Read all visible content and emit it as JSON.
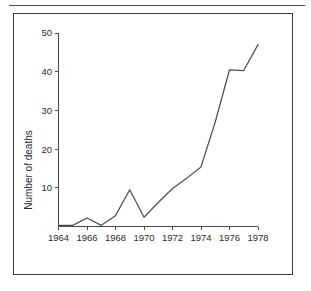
{
  "figure": {
    "has_top_rule": true,
    "has_frame_border": true,
    "frame_color": "#3c3c3c",
    "background_color": "#ffffff",
    "line_color": "#4f4f4f"
  },
  "chart_data": {
    "type": "line",
    "title": "",
    "xlabel": "",
    "ylabel": "Number of deaths",
    "xlim": [
      1964,
      1978
    ],
    "ylim": [
      0,
      50
    ],
    "grid": false,
    "legend": "none",
    "x_tick_labels": [
      "1964",
      "1966",
      "1968",
      "1970",
      "1972",
      "1974",
      "1976",
      "1978"
    ],
    "x_ticks": [
      1964,
      1966,
      1968,
      1970,
      1972,
      1974,
      1976,
      1978
    ],
    "y_tick_labels": [
      "10",
      "20",
      "30",
      "40",
      "50"
    ],
    "y_ticks": [
      10,
      20,
      30,
      40,
      50
    ],
    "x": [
      1964,
      1965,
      1966,
      1967,
      1968,
      1969,
      1970,
      1971,
      1972,
      1973,
      1974,
      1975,
      1976,
      1977,
      1978
    ],
    "values": [
      0.3,
      0.3,
      2.2,
      0.3,
      2.8,
      9.5,
      2.4,
      6.2,
      9.8,
      12.5,
      15.4,
      27.0,
      40.5,
      40.3,
      47.0
    ],
    "series": [
      {
        "name": "Number of deaths",
        "values": [
          0.3,
          0.3,
          2.2,
          0.3,
          2.8,
          9.5,
          2.4,
          6.2,
          9.8,
          12.5,
          15.4,
          27.0,
          40.5,
          40.3,
          47.0
        ]
      }
    ]
  }
}
